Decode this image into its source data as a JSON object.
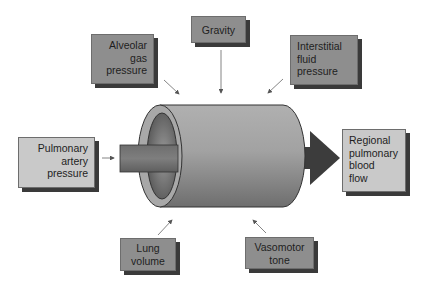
{
  "diagram": {
    "center": {
      "label": "Pulmonary vessel (cylinder)",
      "input_label": "Pulmonary artery pressure",
      "output_label": "Regional pulmonary blood flow"
    },
    "nodes": [
      {
        "id": "alveolar",
        "lines": [
          "Alveolar",
          "gas",
          "pressure"
        ],
        "align": "right",
        "shade": "dark"
      },
      {
        "id": "gravity",
        "lines": [
          "Gravity"
        ],
        "align": "center",
        "shade": "dark"
      },
      {
        "id": "interstitial",
        "lines": [
          "Interstitial",
          "fluid",
          "pressure"
        ],
        "align": "left",
        "shade": "dark"
      },
      {
        "id": "pulmonary-artery",
        "lines": [
          "Pulmonary",
          "artery",
          "pressure"
        ],
        "align": "right",
        "shade": "light"
      },
      {
        "id": "regional-flow",
        "lines": [
          "Regional",
          "pulmonary",
          "blood",
          "flow"
        ],
        "align": "left",
        "shade": "light"
      },
      {
        "id": "lung-volume",
        "lines": [
          "Lung",
          "volume"
        ],
        "align": "center",
        "shade": "dark"
      },
      {
        "id": "vasomotor",
        "lines": [
          "Vasomotor",
          "tone"
        ],
        "align": "center",
        "shade": "dark"
      }
    ],
    "edges": [
      {
        "from": "alveolar",
        "to": "vessel"
      },
      {
        "from": "gravity",
        "to": "vessel"
      },
      {
        "from": "interstitial",
        "to": "vessel"
      },
      {
        "from": "pulmonary-artery",
        "to": "vessel"
      },
      {
        "from": "lung-volume",
        "to": "vessel"
      },
      {
        "from": "vasomotor",
        "to": "vessel"
      },
      {
        "from": "vessel",
        "to": "regional-flow"
      }
    ],
    "colors": {
      "dark_box": "#8e8e8e",
      "light_box": "#c9c9c9",
      "shadow": "#3a3a3a",
      "cylinder": "#9a9a9a",
      "output_arrow": "#3c3c3c"
    }
  }
}
